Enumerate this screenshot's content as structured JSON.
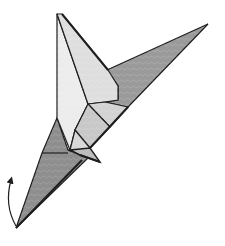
{
  "figure": {
    "type": "origami-diagram-step",
    "colors": {
      "background": "#ffffff",
      "light_face": "#e6e6e6",
      "mid_face": "#cfcfcf",
      "dark_face": "#9a9a9a",
      "outline": "#1e1e1e"
    },
    "annotations": {
      "arrow": "curved rotate/fold arrow near bottom-left tip pointing upward"
    }
  }
}
